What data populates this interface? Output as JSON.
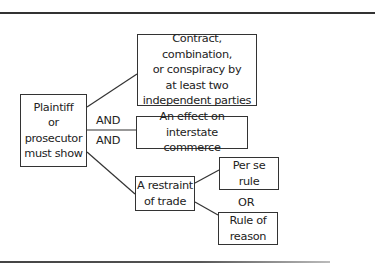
{
  "diagram": {
    "root": {
      "text": "Plaintiff\nor\nprosecutor\nmust show"
    },
    "requirements": [
      {
        "text": "Contract, combination,\nor conspiracy by\nat least two\nindependent parties"
      },
      {
        "text": "An effect on\ninterstate commerce"
      },
      {
        "text": "A restraint\nof trade"
      }
    ],
    "tests": [
      {
        "text": "Per se\nrule"
      },
      {
        "text": "Rule of\nreason"
      }
    ],
    "connectors": {
      "and_1": "AND",
      "and_2": "AND",
      "or": "OR"
    }
  }
}
